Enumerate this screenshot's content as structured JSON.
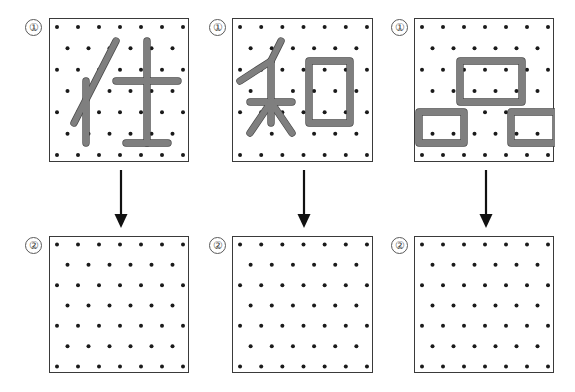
{
  "figure": {
    "title": "",
    "canvas": {
      "width": 575,
      "height": 392
    },
    "colors": {
      "background": "#ffffff",
      "panel_border": "#3a3a3a",
      "dot": "#1a1a1a",
      "band_fill": "#7f7f7f",
      "band_outline": "#4a4a4a",
      "arrow": "#111111",
      "badge_border": "#5a5a5a",
      "badge_text": "#3c3c3c"
    },
    "grid": {
      "rows": 7,
      "cols_full_row": 7,
      "cols_offset_row": 6,
      "pattern": "staggered",
      "dot_radius_px": 2
    }
  },
  "columns": [
    {
      "id": "column-1",
      "top": {
        "badge_label": "①",
        "shape_name": "kanji-shi",
        "strokes": [
          {
            "name": "left-diagonal-long",
            "type": "line",
            "from": [
              0.5,
              0.5
            ],
            "to": [
              3.5,
              0.5
            ]
          },
          {
            "name": "left-vertical",
            "type": "line",
            "from": [
              1.5,
              2.5
            ],
            "to": [
              1.5,
              6.5
            ]
          },
          {
            "name": "right-horizontal",
            "type": "line",
            "from": [
              3.5,
              2.5
            ],
            "to": [
              7.5,
              2.5
            ]
          },
          {
            "name": "right-vertical",
            "type": "line",
            "from": [
              5.5,
              0.5
            ],
            "to": [
              5.5,
              6.5
            ]
          },
          {
            "name": "bottom-horizontal",
            "type": "line",
            "from": [
              4.5,
              6.5
            ],
            "to": [
              6.5,
              6.5
            ]
          }
        ]
      },
      "arrow": {
        "name": "down-arrow-1",
        "direction": "down"
      },
      "bottom": {
        "badge_label": "②",
        "shape_name": "empty-grid"
      }
    },
    {
      "id": "column-2",
      "top": {
        "badge_label": "①",
        "shape_name": "kanji-wa",
        "strokes": [
          {
            "name": "upper-left-diagonal",
            "type": "line"
          },
          {
            "name": "upper-right-diagonal",
            "type": "line"
          },
          {
            "name": "center-vertical",
            "type": "line"
          },
          {
            "name": "center-horizontal",
            "type": "line"
          },
          {
            "name": "lower-left-diagonal",
            "type": "line"
          },
          {
            "name": "lower-right-diagonal",
            "type": "line"
          },
          {
            "name": "mouth-rectangle",
            "type": "rect"
          }
        ]
      },
      "arrow": {
        "name": "down-arrow-2",
        "direction": "down"
      },
      "bottom": {
        "badge_label": "②",
        "shape_name": "empty-grid"
      }
    },
    {
      "id": "column-3",
      "top": {
        "badge_label": "①",
        "shape_name": "three-rectangles",
        "strokes": [
          {
            "name": "top-wide-rectangle",
            "type": "rect"
          },
          {
            "name": "bottom-left-rectangle",
            "type": "rect"
          },
          {
            "name": "bottom-right-rectangle",
            "type": "rect"
          }
        ]
      },
      "arrow": {
        "name": "down-arrow-3",
        "direction": "down"
      },
      "bottom": {
        "badge_label": "②",
        "shape_name": "empty-grid"
      }
    }
  ]
}
